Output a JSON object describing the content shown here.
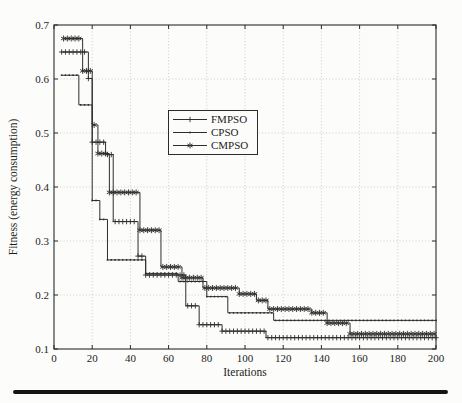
{
  "figure": {
    "x_axis_title": "Iterations",
    "y_axis_title": "Fitness (energy consumption)"
  },
  "legend": {
    "items": [
      {
        "label": "FMPSO",
        "marker": "plus"
      },
      {
        "label": "CPSO",
        "marker": "dot"
      },
      {
        "label": "CMPSO",
        "marker": "asterisk"
      }
    ]
  },
  "chart_data": {
    "type": "line",
    "title": "",
    "xlabel": "Iterations",
    "ylabel": "Fitness (energy consumption)",
    "xlim": [
      0,
      200
    ],
    "ylim": [
      0.1,
      0.7
    ],
    "xticks": [
      0,
      20,
      40,
      60,
      80,
      100,
      120,
      140,
      160,
      180,
      200
    ],
    "yticks": [
      0.1,
      0.2,
      0.3,
      0.4,
      0.5,
      0.6,
      0.7
    ],
    "grid": "dotted",
    "legend_position": "upper-left-of-center",
    "line_color": "#2e2e2e",
    "grid_color": "#bfbfbf",
    "marker_step_iterations": 2,
    "series": [
      {
        "name": "FMPSO",
        "marker": "plus",
        "points": [
          [
            4,
            0.65
          ],
          [
            18,
            0.601
          ],
          [
            20,
            0.483
          ],
          [
            27,
            0.46
          ],
          [
            31,
            0.336
          ],
          [
            44,
            0.272
          ],
          [
            48,
            0.237
          ],
          [
            69,
            0.18
          ],
          [
            76,
            0.145
          ],
          [
            88,
            0.133
          ],
          [
            111,
            0.121
          ],
          [
            200,
            0.121
          ]
        ]
      },
      {
        "name": "CPSO",
        "marker": "dot",
        "points": [
          [
            4,
            0.607
          ],
          [
            13,
            0.552
          ],
          [
            20,
            0.375
          ],
          [
            24,
            0.34
          ],
          [
            28,
            0.265
          ],
          [
            48,
            0.24
          ],
          [
            65,
            0.225
          ],
          [
            80,
            0.197
          ],
          [
            91,
            0.167
          ],
          [
            115,
            0.153
          ],
          [
            200,
            0.153
          ]
        ]
      },
      {
        "name": "CMPSO",
        "marker": "asterisk",
        "points": [
          [
            5,
            0.675
          ],
          [
            15,
            0.615
          ],
          [
            20,
            0.515
          ],
          [
            23,
            0.462
          ],
          [
            29,
            0.39
          ],
          [
            45,
            0.32
          ],
          [
            56,
            0.252
          ],
          [
            67,
            0.232
          ],
          [
            78,
            0.213
          ],
          [
            97,
            0.202
          ],
          [
            106,
            0.19
          ],
          [
            112,
            0.174
          ],
          [
            135,
            0.167
          ],
          [
            143,
            0.148
          ],
          [
            155,
            0.128
          ],
          [
            200,
            0.128
          ]
        ]
      }
    ]
  }
}
